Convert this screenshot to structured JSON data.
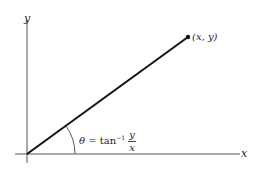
{
  "diagram": {
    "axes": {
      "x_label": "x",
      "y_label": "y"
    },
    "point": {
      "label": "(x, y)"
    },
    "angle": {
      "symbol": "θ",
      "equals": "=",
      "func": "tan",
      "exponent": "−1",
      "numerator": "y",
      "denominator": "x"
    },
    "colors": {
      "line": "#111111",
      "axis": "#555555"
    }
  }
}
